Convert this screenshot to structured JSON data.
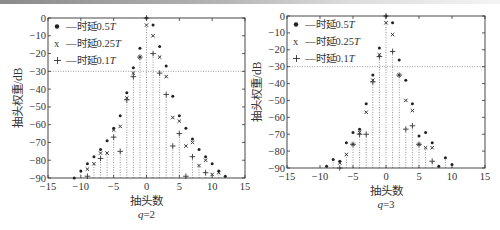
{
  "figure": {
    "panels": [
      {
        "caption": "q=2",
        "caption_var": "q",
        "caption_val": "=2",
        "xlabel": "抽头数",
        "ylabel": "抽头权重/dB",
        "legend": [
          {
            "marker": "•",
            "prefix": "—时延",
            "value": "0.5",
            "unit": "T"
          },
          {
            "marker": "x",
            "prefix": "—时延",
            "value": "0.25",
            "unit": "T"
          },
          {
            "marker": "+",
            "prefix": "—时延",
            "value": "0.1",
            "unit": "T"
          }
        ]
      },
      {
        "caption": "q=3",
        "caption_var": "q",
        "caption_val": "=3",
        "xlabel": "抽头数",
        "ylabel": "抽头权重/dB",
        "legend": [
          {
            "marker": "•",
            "prefix": "—时延",
            "value": "0.5",
            "unit": "T"
          },
          {
            "marker": "x",
            "prefix": "—时延",
            "value": "0.25",
            "unit": "T"
          },
          {
            "marker": "+",
            "prefix": "—时延",
            "value": "0.1",
            "unit": "T"
          }
        ]
      }
    ]
  },
  "chart_data": [
    {
      "type": "scatter",
      "subtype": "stem",
      "title": "q=2",
      "xlabel": "抽头数",
      "ylabel": "抽头权重/dB",
      "xlim": [
        -15,
        15
      ],
      "ylim": [
        -90,
        0
      ],
      "xticks": [
        -15,
        -10,
        -5,
        0,
        5,
        10,
        15
      ],
      "yticks": [
        0,
        -10,
        -20,
        -30,
        -40,
        -50,
        -60,
        -70,
        -80,
        -90
      ],
      "reference_line_y": -30,
      "grid": false,
      "legend_position": "upper left",
      "series": [
        {
          "name": "时延0.5T",
          "marker": "dot",
          "x": [
            -11,
            -10,
            -9,
            -8,
            -7,
            -6,
            -5,
            -4,
            -3,
            -2,
            -1,
            0,
            1,
            2,
            3,
            4,
            5,
            6,
            7,
            8,
            9,
            10,
            11,
            12
          ],
          "y": [
            -90,
            -86,
            -82,
            -78,
            -74,
            -69,
            -62,
            -55,
            -42,
            -28,
            -17,
            0,
            -4,
            -16,
            -27,
            -44,
            -55,
            -62,
            -68,
            -74,
            -78,
            -82,
            -86,
            -89
          ]
        },
        {
          "name": "时延0.25T",
          "marker": "x",
          "x": [
            -9,
            -8,
            -7,
            -6,
            -5,
            -4,
            -3,
            -2,
            -1,
            0,
            1,
            2,
            3,
            4,
            5,
            6,
            7,
            8,
            9,
            10,
            11
          ],
          "y": [
            -85,
            -82,
            -76,
            -76,
            -63,
            -61,
            -45,
            -31,
            -22,
            -4,
            -10,
            -22,
            -33,
            -56,
            -58,
            -72,
            -70,
            -83,
            -80,
            -88,
            -87
          ]
        },
        {
          "name": "时延0.1T",
          "marker": "plus",
          "x": [
            -9,
            -7,
            -5,
            -4,
            -3,
            -2,
            -1,
            0,
            1,
            2,
            3,
            4,
            5,
            6,
            7,
            9
          ],
          "y": [
            -89,
            -79,
            -67,
            -75,
            -46,
            -33,
            -22,
            0,
            -20,
            -31,
            -43,
            -72,
            -65,
            -89,
            -78,
            -87
          ]
        }
      ]
    },
    {
      "type": "scatter",
      "subtype": "stem",
      "title": "q=3",
      "xlabel": "抽头数",
      "ylabel": "抽头权重/dB",
      "xlim": [
        -15,
        15
      ],
      "ylim": [
        -90,
        0
      ],
      "xticks": [
        -15,
        -10,
        -5,
        0,
        5,
        10,
        15
      ],
      "yticks": [
        0,
        -10,
        -20,
        -30,
        -40,
        -50,
        -60,
        -70,
        -80,
        -90
      ],
      "reference_line_y": -30,
      "grid": false,
      "legend_position": "upper left",
      "series": [
        {
          "name": "时延0.5T",
          "marker": "dot",
          "x": [
            -9,
            -8,
            -7,
            -6,
            -5,
            -4,
            -3,
            -2,
            -1,
            0,
            1,
            2,
            3,
            4,
            5,
            6,
            7,
            8,
            9,
            10
          ],
          "y": [
            -89,
            -85,
            -86,
            -75,
            -69,
            -67,
            -52,
            -35,
            -19,
            0,
            -4,
            -26,
            -38,
            -52,
            -71,
            -69,
            -75,
            -89,
            -84,
            -88
          ]
        },
        {
          "name": "时延0.25T",
          "marker": "x",
          "x": [
            -7,
            -6,
            -5,
            -4,
            -3,
            -2,
            -1,
            0,
            1,
            2,
            3,
            4,
            5,
            6,
            7
          ],
          "y": [
            -87,
            -82,
            -76,
            -69,
            -57,
            -38,
            -23,
            -4,
            -11,
            -35,
            -50,
            -56,
            -76,
            -78,
            -78
          ]
        },
        {
          "name": "时延0.1T",
          "marker": "plus",
          "x": [
            -7,
            -5,
            -4,
            -3,
            -2,
            -1,
            0,
            1,
            2,
            3,
            4,
            5,
            7
          ],
          "y": [
            -90,
            -76,
            -70,
            -70,
            -39,
            -24,
            0,
            -21,
            -35,
            -67,
            -65,
            -76,
            -86
          ]
        }
      ]
    }
  ]
}
